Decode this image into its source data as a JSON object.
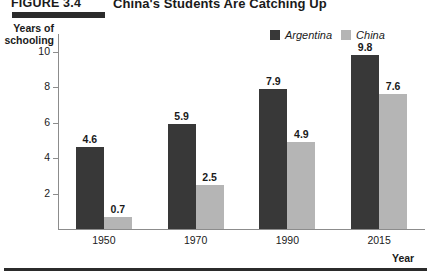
{
  "figure": {
    "number": "FIGURE 3.4",
    "title": "China's Students Are Catching Up"
  },
  "colors": {
    "argentina": "#383838",
    "china": "#b5b5b5",
    "axis": "#8c8c8c",
    "rule": "#2b2b2b",
    "text": "#1a1a1a"
  },
  "chart_data": {
    "type": "bar",
    "title": "China's Students Are Catching Up",
    "subtitle": "FIGURE 3.4",
    "categories": [
      "1950",
      "1970",
      "1990",
      "2015"
    ],
    "series": [
      {
        "name": "Argentina",
        "values": [
          4.6,
          5.9,
          7.9,
          9.8
        ],
        "color": "#383838"
      },
      {
        "name": "China",
        "values": [
          0.7,
          2.5,
          4.9,
          7.6
        ],
        "color": "#b5b5b5"
      }
    ],
    "xlabel": "Year",
    "ylabel": "Years of schooling",
    "ylabel_line1": "Years of",
    "ylabel_line2": "schooling",
    "ylim": [
      0,
      11
    ],
    "yticks": [
      2,
      4,
      6,
      8,
      10
    ],
    "ytick_labels": [
      "2",
      "4",
      "6",
      "8",
      "10"
    ],
    "grid": false,
    "legend_position": "top-right",
    "value_labels": true
  }
}
